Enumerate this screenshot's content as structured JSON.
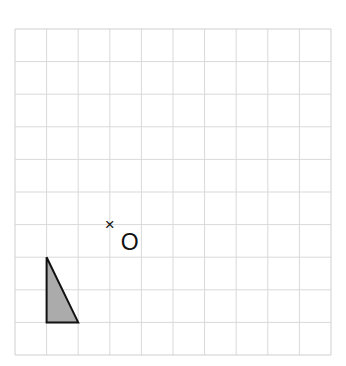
{
  "diagram": {
    "type": "grid-transformation",
    "grid": {
      "columns": 10,
      "rows": 10,
      "left": 15,
      "top": 29,
      "right": 331,
      "bottom": 355,
      "line_color": "#d9d9d9",
      "border_color": "#cfcfcf"
    },
    "shape": {
      "kind": "triangle",
      "vertices_grid": [
        [
          1,
          7
        ],
        [
          1,
          9
        ],
        [
          2,
          9
        ]
      ],
      "fill": "#ababab",
      "stroke": "#111111"
    },
    "center_point": {
      "marker": "×",
      "label": "O",
      "position_grid": [
        3,
        6
      ],
      "color": "#111111"
    }
  }
}
